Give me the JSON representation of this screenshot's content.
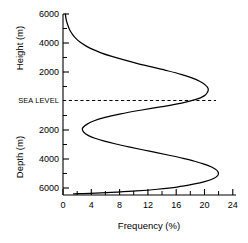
{
  "chart_data": {
    "type": "line",
    "title": "",
    "subtitle": "",
    "xlabel": "Frequency (%)",
    "ylabel_upper": "Height (m)",
    "ylabel_lower": "Depth (m)",
    "xlim": [
      0,
      25.5
    ],
    "ylim": [
      -6600,
      6000
    ],
    "grid": false,
    "legend": "none",
    "x_ticks_major": [
      0,
      4,
      8,
      12,
      16,
      20,
      24
    ],
    "x_tick_labels": [
      "0",
      "4",
      "8",
      "12",
      "16",
      "20",
      "24"
    ],
    "x_ticks_minor": [
      2,
      6,
      10,
      14,
      18,
      22
    ],
    "y_ticks_major_upper": [
      6000,
      4000,
      2000
    ],
    "y_tick_labels_upper": [
      "6000",
      "4000",
      "2000"
    ],
    "y_ticks_major_lower": [
      -2000,
      -4000,
      -6000
    ],
    "y_tick_labels_lower": [
      "2000",
      "4000",
      "6000"
    ],
    "y_ticks_minor": [
      5000,
      3000,
      1000,
      -1000,
      -3000,
      -5000
    ],
    "sea_level_label": "SEA LEVEL",
    "sea_level_value": 0,
    "series": [
      {
        "name": "Hypsometric frequency",
        "x": [
          0.35,
          0.4,
          0.5,
          0.65,
          0.85,
          1.1,
          1.45,
          1.9,
          2.5,
          3.3,
          4.3,
          5.6,
          7.2,
          9.0,
          11.0,
          13.2,
          15.4,
          17.4,
          19.0,
          20.2,
          21.0,
          21.4,
          21.3,
          20.8,
          19.6,
          17.5,
          14.6,
          11.4,
          8.5,
          6.2,
          4.5,
          3.45,
          2.95,
          2.85,
          3.1,
          3.7,
          4.7,
          6.1,
          7.8,
          9.7,
          11.7,
          13.8,
          15.8,
          17.7,
          19.4,
          20.8,
          21.9,
          22.6,
          22.9,
          22.8,
          22.2,
          21.0,
          19.2,
          16.8,
          13.9,
          10.8,
          7.9,
          5.6,
          4.0,
          2.9,
          2.2,
          1.8,
          1.55
        ],
        "y": [
          6000,
          5800,
          5550,
          5300,
          5050,
          4800,
          4550,
          4300,
          4050,
          3800,
          3550,
          3300,
          3050,
          2800,
          2550,
          2300,
          2050,
          1800,
          1550,
          1300,
          1050,
          800,
          550,
          300,
          50,
          -200,
          -450,
          -700,
          -950,
          -1200,
          -1450,
          -1700,
          -1900,
          -2050,
          -2250,
          -2450,
          -2650,
          -2850,
          -3050,
          -3250,
          -3450,
          -3650,
          -3850,
          -4050,
          -4250,
          -4450,
          -4650,
          -4850,
          -5050,
          -5250,
          -5450,
          -5650,
          -5850,
          -6050,
          -6200,
          -6320,
          -6400,
          -6450,
          -6480,
          -6500,
          -6510,
          -6515,
          -6520
        ],
        "units_x": "%",
        "units_y": "m"
      }
    ],
    "annotations": [
      {
        "label": "Continental peak",
        "x": 21.4,
        "y": 800
      },
      {
        "label": "Abyssal peak",
        "x": 22.9,
        "y": -5050
      },
      {
        "label": "Shelf-slope minimum",
        "x": 2.85,
        "y": -2050
      }
    ]
  },
  "axes": {
    "x_axis_title": "Frequency (%)",
    "y_axis_title_upper": "Height (m)",
    "y_axis_title_lower": "Depth (m)"
  },
  "colors": {
    "background": "#ffffff",
    "curve": "#000000",
    "axis": "#000000",
    "sea_level_line": "#000000",
    "text": "#000000"
  }
}
